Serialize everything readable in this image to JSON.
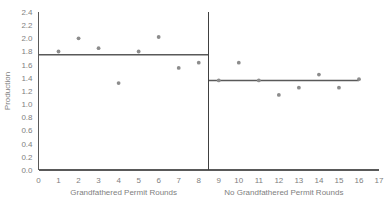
{
  "chart_data": {
    "type": "scatter",
    "title": "",
    "xlabel": "",
    "ylabel": "Production",
    "xlim": [
      0,
      17
    ],
    "ylim": [
      0.0,
      2.4
    ],
    "xticks": [
      "0",
      "1",
      "2",
      "3",
      "4",
      "5",
      "6",
      "7",
      "8",
      "9",
      "10",
      "11",
      "12",
      "13",
      "14",
      "15",
      "16",
      "17"
    ],
    "yticks": [
      "0.0",
      "0.2",
      "0.4",
      "0.6",
      "0.8",
      "1.0",
      "1.2",
      "1.4",
      "1.6",
      "1.8",
      "2.0",
      "2.2",
      "2.4"
    ],
    "grid": false,
    "legend": "none",
    "point_color": "#8c8c8c",
    "line_color": "#595959",
    "text_color": "#808080",
    "panels": [
      {
        "name": "grandfathered",
        "xlabel": "Grandfathered Permit Rounds",
        "x_range": [
          0,
          8.5
        ],
        "mean_line": 1.75,
        "points": [
          {
            "x": 1,
            "y": 1.8
          },
          {
            "x": 2,
            "y": 2.0
          },
          {
            "x": 3,
            "y": 1.85
          },
          {
            "x": 4,
            "y": 1.32
          },
          {
            "x": 5,
            "y": 1.8
          },
          {
            "x": 6,
            "y": 2.02
          },
          {
            "x": 7,
            "y": 1.55
          },
          {
            "x": 8,
            "y": 1.63
          }
        ]
      },
      {
        "name": "no-grandfathered",
        "xlabel": "No Grandfathered Permit Rounds",
        "x_range": [
          8.5,
          16
        ],
        "mean_line": 1.36,
        "points": [
          {
            "x": 9,
            "y": 1.36
          },
          {
            "x": 10,
            "y": 1.63
          },
          {
            "x": 11,
            "y": 1.36
          },
          {
            "x": 12,
            "y": 1.14
          },
          {
            "x": 13,
            "y": 1.25
          },
          {
            "x": 14,
            "y": 1.45
          },
          {
            "x": 15,
            "y": 1.25
          },
          {
            "x": 16,
            "y": 1.38
          }
        ]
      }
    ],
    "divider_x": 8.5
  }
}
